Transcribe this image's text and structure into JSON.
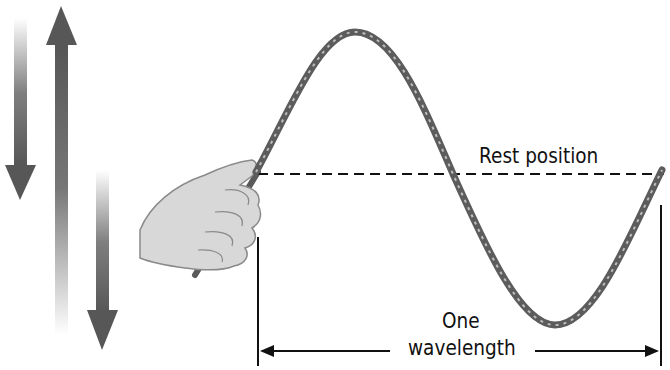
{
  "diagram": {
    "type": "transverse wave on a rope",
    "labels": {
      "rest_position": "Rest position",
      "wavelength_line1": "One",
      "wavelength_line2": "wavelength"
    },
    "elements": [
      "motion-arrows (down, up, down)",
      "hand holding rope",
      "rope wave (crest then trough)",
      "dashed rest position line",
      "wavelength dimension arrow"
    ],
    "colors": {
      "rope": "#6e6e6e",
      "arrow": "#5a5a5a",
      "line": "#111111",
      "background": "#ffffff"
    }
  }
}
